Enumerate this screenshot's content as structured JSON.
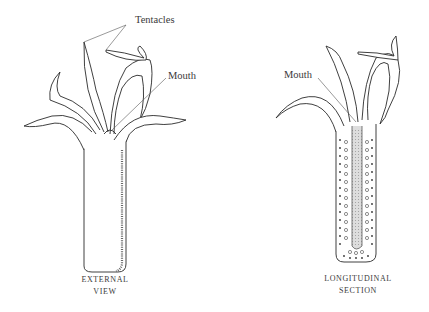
{
  "figures": [
    {
      "id": "external-view",
      "caption_line1": "EXTERNAL",
      "caption_line2": "VIEW",
      "labels": {
        "tentacles": "Tentacles",
        "mouth": "Mouth"
      }
    },
    {
      "id": "longitudinal-section",
      "caption_line1": "LONGITUDINAL",
      "caption_line2": "SECTION",
      "labels": {
        "mouth": "Mouth"
      }
    }
  ],
  "colors": {
    "ink": "#2a2a2a",
    "stipple": "#555555",
    "background": "#ffffff"
  }
}
